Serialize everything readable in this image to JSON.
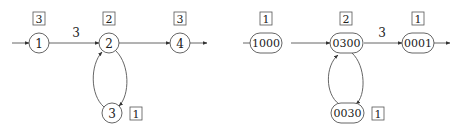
{
  "diagrams": [
    {
      "id": "left",
      "nodes": [
        {
          "key": "n1",
          "label": "1",
          "badge": "3",
          "cx": 39,
          "cy": 43,
          "shape": "circle"
        },
        {
          "key": "n2",
          "label": "2",
          "badge": "2",
          "cx": 109,
          "cy": 43,
          "shape": "circle"
        },
        {
          "key": "n4",
          "label": "4",
          "badge": "3",
          "cx": 180,
          "cy": 43,
          "shape": "circle"
        },
        {
          "key": "n3",
          "label": "3",
          "badge": "1",
          "cx": 112,
          "cy": 113,
          "shape": "circle"
        }
      ],
      "edges": [
        {
          "from": "start",
          "to": "n1",
          "label": ""
        },
        {
          "from": "n1",
          "to": "n2",
          "label": "3"
        },
        {
          "from": "n2",
          "to": "n4",
          "label": ""
        },
        {
          "from": "n4",
          "to": "end",
          "label": ""
        },
        {
          "from": "n2",
          "to": "n3",
          "label": ""
        },
        {
          "from": "n3",
          "to": "n2",
          "label": ""
        }
      ]
    },
    {
      "id": "right",
      "nodes": [
        {
          "key": "m1000",
          "label": "1000",
          "badge": "1",
          "cx": 266,
          "cy": 43,
          "shape": "rounded"
        },
        {
          "key": "m0300",
          "label": "0300",
          "badge": "2",
          "cx": 346,
          "cy": 43,
          "shape": "rounded"
        },
        {
          "key": "m0001",
          "label": "0001",
          "badge": "1",
          "cx": 418,
          "cy": 43,
          "shape": "rounded"
        },
        {
          "key": "m0030",
          "label": "0030",
          "badge": "1",
          "cx": 347,
          "cy": 113,
          "shape": "rounded"
        }
      ],
      "edges": [
        {
          "from": "start",
          "to": "m1000",
          "label": ""
        },
        {
          "from": "m1000",
          "to": "m0300",
          "label": ""
        },
        {
          "from": "m0300",
          "to": "m0001",
          "label": "3"
        },
        {
          "from": "m0001",
          "to": "end",
          "label": ""
        },
        {
          "from": "m0300",
          "to": "m0030",
          "label": ""
        },
        {
          "from": "m0030",
          "to": "m0300",
          "label": ""
        }
      ]
    }
  ],
  "labels": {
    "left": {
      "n1": "1",
      "n2": "2",
      "n3": "3",
      "n4": "4",
      "b1": "3",
      "b2": "2",
      "b3": "1",
      "b4": "3",
      "e12": "3"
    },
    "right": {
      "m1000": "1000",
      "m0300": "0300",
      "m0001": "0001",
      "m0030": "0030",
      "b1000": "1",
      "b0300": "2",
      "b0001": "1",
      "b0030": "1",
      "e0300_0001": "3"
    }
  }
}
